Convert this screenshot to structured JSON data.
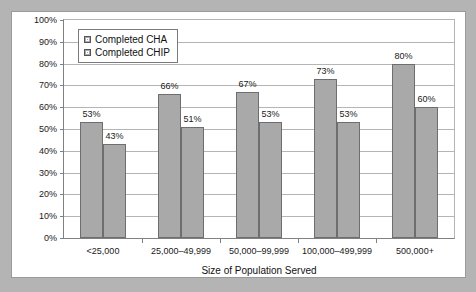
{
  "chart_data": {
    "type": "bar",
    "title": "",
    "xlabel": "Size of Population Served",
    "ylabel": "",
    "ylim": [
      0,
      100
    ],
    "ytick_labels": [
      "100%",
      "90%",
      "80%",
      "70%",
      "60%",
      "50%",
      "40%",
      "30%",
      "20%",
      "10%",
      "0%"
    ],
    "ytick_values": [
      100,
      90,
      80,
      70,
      60,
      50,
      40,
      30,
      20,
      10,
      0
    ],
    "grid": true,
    "legend_position": "top-left",
    "categories": [
      "<25,000",
      "25,000–49,999",
      "50,000–99,999",
      "100,000–499,999",
      "500,000+"
    ],
    "series": [
      {
        "name": "Completed CHA",
        "color": "#a9a9a9",
        "values": [
          53,
          66,
          67,
          73,
          80
        ],
        "labels": [
          "53%",
          "66%",
          "67%",
          "73%",
          "80%"
        ]
      },
      {
        "name": "Completed CHIP",
        "color": "#a9a9a9",
        "values": [
          43,
          51,
          53,
          53,
          60
        ],
        "labels": [
          "43%",
          "51%",
          "53%",
          "53%",
          "60%"
        ]
      }
    ]
  },
  "legend": {
    "items": [
      {
        "label": "Completed CHA",
        "swatch": "series-swatch"
      },
      {
        "label": "Completed CHIP",
        "swatch": "series-swatch"
      }
    ]
  },
  "colors": {
    "page_background": "#b4b4b4",
    "card_background": "#ffffff",
    "bar_fill": "#a9a9a9",
    "bar_stroke": "#6e6e6e",
    "gridline": "#b5b5b5",
    "axis": "#808080",
    "text": "#111111"
  }
}
